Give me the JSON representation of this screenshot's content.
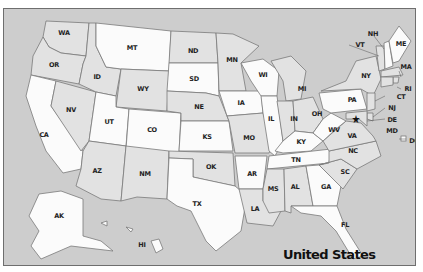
{
  "map": {
    "title": "United States",
    "colors": {
      "background": "#cdcdcd",
      "state_light": "#fbfbfb",
      "state_dark": "#e2e2e2",
      "border": "#7a7a7a",
      "frame": "#6e6e6e"
    },
    "capital_marker": "star-icon",
    "states": {
      "WA": "WA",
      "OR": "OR",
      "CA": "CA",
      "NV": "NV",
      "ID": "ID",
      "MT": "MT",
      "WY": "WY",
      "UT": "UT",
      "CO": "CO",
      "AZ": "AZ",
      "NM": "NM",
      "ND": "ND",
      "SD": "SD",
      "NE": "NE",
      "KS": "KS",
      "OK": "OK",
      "TX": "TX",
      "MN": "MN",
      "IA": "IA",
      "MO": "MO",
      "AR": "AR",
      "LA": "LA",
      "WI": "WI",
      "IL": "IL",
      "MI": "MI",
      "IN": "IN",
      "OH": "OH",
      "KY": "KY",
      "TN": "TN",
      "MS": "MS",
      "AL": "AL",
      "GA": "GA",
      "FL": "FL",
      "SC": "SC",
      "NC": "NC",
      "VA": "VA",
      "WV": "WV",
      "PA": "PA",
      "NY": "NY",
      "VT": "VT",
      "NH": "NH",
      "ME": "ME",
      "MA": "MA",
      "RI": "RI",
      "CT": "CT",
      "NJ": "NJ",
      "DE": "DE",
      "MD": "MD",
      "DC": "DC",
      "AK": "AK",
      "HI": "HI"
    }
  }
}
